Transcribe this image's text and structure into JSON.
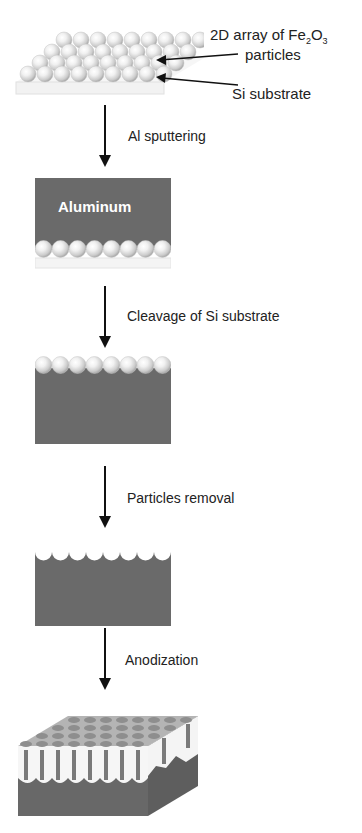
{
  "figure": {
    "type": "process-flow-diagram"
  },
  "stage1": {
    "label_array": "2D array of Fe",
    "label_array_sub1": "2",
    "label_array_mid": "O",
    "label_array_sub2": "3",
    "label_particles": "particles",
    "label_substrate": "Si substrate"
  },
  "steps": [
    {
      "label": "Al sputtering"
    },
    {
      "label": "Cleavage of Si substrate"
    },
    {
      "label": "Particles removal"
    },
    {
      "label": "Anodization"
    }
  ],
  "stage2": {
    "block_label": "Aluminum"
  },
  "colors": {
    "aluminum": "#6a6a6a",
    "particle": "#e8e8e8",
    "substrate": "#f4f4f4",
    "arrow": "#111111"
  }
}
